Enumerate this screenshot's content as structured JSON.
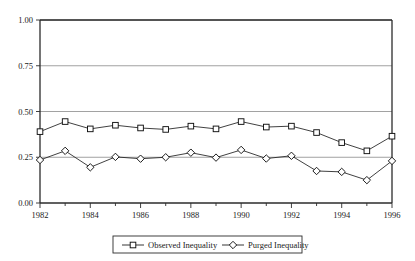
{
  "chart_data": {
    "type": "line",
    "title": "",
    "subtitle": "",
    "xlabel": "",
    "ylabel": "",
    "x": [
      1982,
      1983,
      1984,
      1985,
      1986,
      1987,
      1988,
      1989,
      1990,
      1991,
      1992,
      1993,
      1994,
      1995,
      1996
    ],
    "xlim": [
      1982,
      1996
    ],
    "ylim": [
      0.0,
      1.0
    ],
    "grid": true,
    "grid_axis": "y",
    "legend_position": "bottom-center",
    "y_ticks": [
      0.0,
      0.25,
      0.5,
      0.75,
      1.0
    ],
    "y_tick_labels": [
      "0.00",
      "0.25",
      "0.50",
      "0.75",
      "1.00"
    ],
    "x_ticks": [
      1982,
      1983,
      1984,
      1985,
      1986,
      1987,
      1988,
      1989,
      1990,
      1991,
      1992,
      1993,
      1994,
      1995,
      1996
    ],
    "x_tick_labels": [
      "1982",
      "",
      "1984",
      "",
      "1986",
      "",
      "1988",
      "",
      "1990",
      "",
      "1992",
      "",
      "1994",
      "",
      "1996"
    ],
    "x_major_labels": [
      "1982",
      "1984",
      "1986",
      "1988",
      "1990",
      "1992",
      "1994",
      "1996"
    ],
    "series": [
      {
        "name": "Observed Inequality",
        "marker": "square",
        "color": "#1f1f1f",
        "values": [
          0.39,
          0.445,
          0.405,
          0.425,
          0.41,
          0.402,
          0.42,
          0.405,
          0.445,
          0.415,
          0.42,
          0.385,
          0.33,
          0.285,
          0.365
        ]
      },
      {
        "name": "Purged Inequality",
        "marker": "diamond",
        "color": "#1f1f1f",
        "values": [
          0.235,
          0.285,
          0.195,
          0.252,
          0.242,
          0.25,
          0.275,
          0.248,
          0.29,
          0.243,
          0.258,
          0.175,
          0.17,
          0.125,
          0.23
        ]
      }
    ]
  },
  "legend": {
    "entries": [
      {
        "label": "Observed Inequality",
        "marker": "square-marker"
      },
      {
        "label": "Purged Inequality",
        "marker": "diamond-marker"
      }
    ]
  },
  "axes": {
    "y_labels": [
      "1.00",
      "0.75",
      "0.50",
      "0.25",
      "0.00"
    ],
    "x_labels": [
      "1982",
      "1984",
      "1986",
      "1988",
      "1990",
      "1992",
      "1994",
      "1996"
    ]
  }
}
